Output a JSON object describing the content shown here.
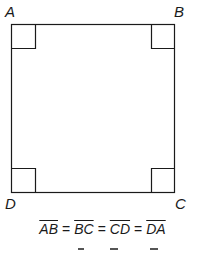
{
  "diagram": {
    "type": "square",
    "vertices": [
      {
        "label": "A",
        "position": "top-left"
      },
      {
        "label": "B",
        "position": "top-right"
      },
      {
        "label": "C",
        "position": "bottom-right"
      },
      {
        "label": "D",
        "position": "bottom-left"
      }
    ],
    "right_angle_marks": 4,
    "stroke_color": "#1a1a1a"
  },
  "equation": {
    "segments": [
      "AB",
      "BC",
      "CD",
      "DA"
    ],
    "operator": "="
  }
}
